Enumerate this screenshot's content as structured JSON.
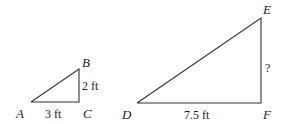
{
  "diagram": {
    "type": "similar-right-triangles",
    "small_triangle": {
      "vertices": {
        "A": "A",
        "B": "B",
        "C": "C"
      },
      "sides": {
        "AC": "3 ft",
        "BC": "2 ft"
      }
    },
    "large_triangle": {
      "vertices": {
        "D": "D",
        "E": "E",
        "F": "F"
      },
      "sides": {
        "DF": "7.5 ft",
        "EF": "?"
      }
    }
  }
}
